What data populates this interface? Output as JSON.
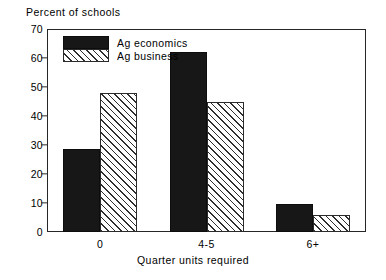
{
  "chart_data": {
    "type": "bar",
    "title": "",
    "ylabel": "Percent of schools",
    "xlabel": "Quarter units required",
    "categories": [
      "0",
      "4-5",
      "6+"
    ],
    "series": [
      {
        "name": "Ag economics",
        "pattern": "solid",
        "values": [
          28.5,
          62.0,
          9.5
        ]
      },
      {
        "name": "Ag business",
        "pattern": "hatched",
        "values": [
          48.0,
          45.0,
          6.0
        ]
      }
    ],
    "ylim": [
      0,
      70
    ],
    "yticks": [
      0,
      10,
      20,
      30,
      40,
      50,
      60,
      70
    ],
    "ytick_labels": [
      "0",
      "10",
      "20",
      "30",
      "40",
      "50",
      "60",
      "70"
    ],
    "grid": false,
    "legend_position": "top-left-inside",
    "colors": {
      "series_1": "#171717",
      "series_2": "#ffffff",
      "axis": "#262626",
      "hatch": "#2e2e2e"
    }
  }
}
